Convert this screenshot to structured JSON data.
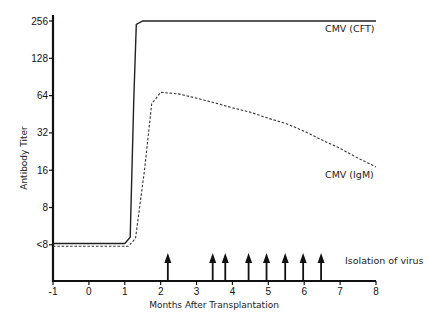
{
  "chart_data": {
    "type": "line",
    "title": "",
    "xlabel": "Months After Transplantation",
    "ylabel": "Antibody Titer",
    "x_ticks": [
      -1,
      0,
      1,
      2,
      3,
      4,
      5,
      6,
      7,
      8
    ],
    "xlim": [
      -1,
      8
    ],
    "y_scale": "log2",
    "y_ticks": [
      {
        "value": 4,
        "label": "<8"
      },
      {
        "value": 8,
        "label": "8"
      },
      {
        "value": 16,
        "label": "16"
      },
      {
        "value": 32,
        "label": "32"
      },
      {
        "value": 64,
        "label": "64"
      },
      {
        "value": 128,
        "label": "128"
      },
      {
        "value": 256,
        "label": "256"
      }
    ],
    "ylim": [
      2,
      256
    ],
    "grid": false,
    "series": [
      {
        "name": "CMV (CFT)",
        "style": "solid",
        "points": [
          [
            -1,
            4.1
          ],
          [
            1.0,
            4.1
          ],
          [
            1.15,
            4.6
          ],
          [
            1.25,
            60
          ],
          [
            1.32,
            240
          ],
          [
            1.5,
            256
          ],
          [
            2,
            256
          ],
          [
            4,
            256
          ],
          [
            6,
            256
          ],
          [
            8,
            256
          ]
        ]
      },
      {
        "name": "CMV (IgM)",
        "style": "dashed",
        "points": [
          [
            -1,
            3.9
          ],
          [
            1.1,
            3.9
          ],
          [
            1.3,
            4.5
          ],
          [
            1.55,
            16
          ],
          [
            1.75,
            55
          ],
          [
            2.0,
            68
          ],
          [
            2.5,
            66
          ],
          [
            3.0,
            61
          ],
          [
            3.5,
            56
          ],
          [
            4.0,
            51
          ],
          [
            4.5,
            47
          ],
          [
            5.0,
            42
          ],
          [
            5.5,
            38
          ],
          [
            6.0,
            33
          ],
          [
            6.5,
            28
          ],
          [
            7.0,
            24
          ],
          [
            7.5,
            20
          ],
          [
            8.0,
            17
          ]
        ]
      }
    ],
    "annotations": {
      "virus_isolation_label": "Isolation of virus",
      "virus_isolation_months": [
        2.2,
        3.45,
        3.8,
        4.45,
        4.95,
        5.47,
        5.97,
        6.47
      ]
    }
  },
  "labels": {
    "series_cft": "CMV (CFT)",
    "series_igm": "CMV (IgM)",
    "isolation": "Isolation of virus",
    "xlabel": "Months After Transplantation",
    "ylabel": "Antibody Titer"
  }
}
